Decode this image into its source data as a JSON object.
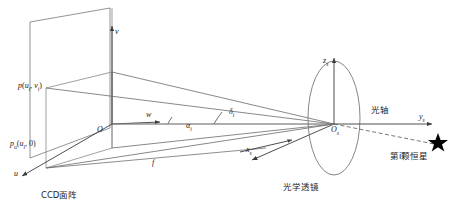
{
  "figure": {
    "kind": "star-sensor-imaging-geometry",
    "background": "#ffffff",
    "line_color": "#555555",
    "text_color": "#1a1a1a",
    "star_color": "#000000"
  },
  "labels": {
    "image_point": "p",
    "image_point_args": "(u",
    "image_point_sub_i": "i",
    "image_point_mid": ", v",
    "image_point_sub_i2": "i",
    "image_point_end": ")",
    "image_point_full": "p(u, v)",
    "u_axis_point": "p",
    "u_axis_point_sub": "u",
    "u_axis_point_args": "(u",
    "u_axis_point_sub_i": "i",
    "u_axis_point_end": ", 0)",
    "u_axis_point_full": "p(u, 0)",
    "axis_v": "v",
    "axis_u": "u",
    "axis_w": "w",
    "origin_o": "O",
    "focal_length": "f",
    "angle_alpha": "α",
    "angle_alpha_sub": "i",
    "angle_delta": "δ",
    "angle_delta_sub": "i",
    "axis_zs": "z",
    "axis_zs_sub": "s",
    "axis_ys": "y",
    "axis_ys_sub": "s",
    "axis_xs": "x",
    "axis_xs_sub": "s",
    "origin_os": "O",
    "origin_os_sub": "s",
    "ccd_plane": "CCD面阵",
    "optical_axis": "光轴",
    "optical_lens": "光学透镜",
    "star_label": "第i颗恒星"
  },
  "geometry": {
    "ccd_plane_quad": "30,22 110,8 110,128 30,158",
    "image_rect": "46,88 112,72 112,148 46,168",
    "lens_ellipse": {
      "cx": 334,
      "cy": 118,
      "rx": 26,
      "ry": 57
    },
    "star_point": {
      "x": 438,
      "y": 142
    },
    "lens_center": {
      "x": 334,
      "y": 124
    }
  }
}
